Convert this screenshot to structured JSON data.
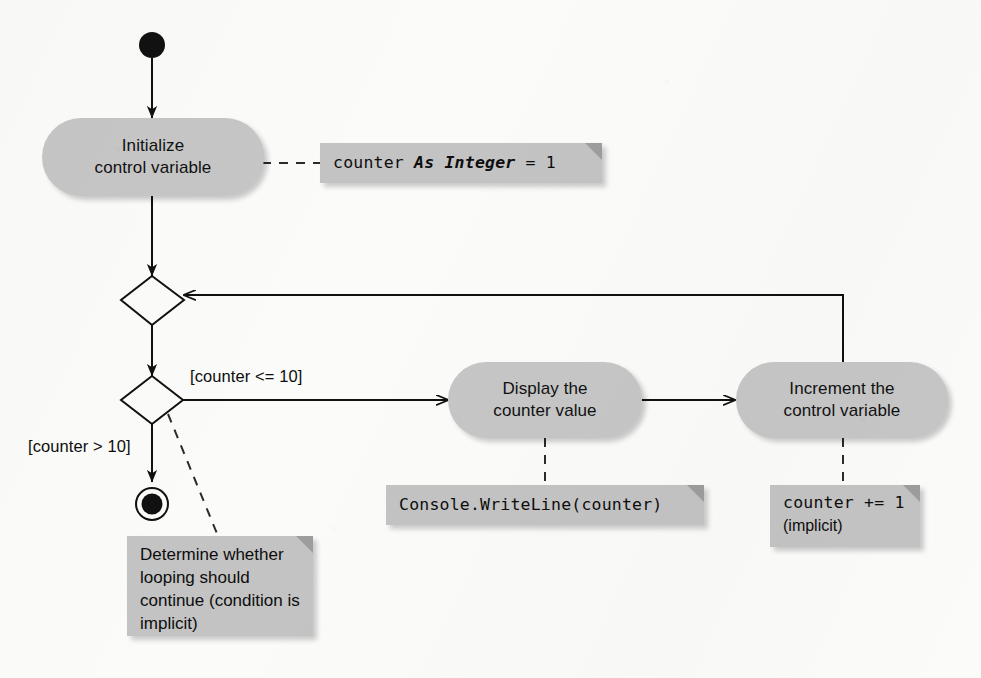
{
  "diagram": {
    "type": "uml-activity-diagram",
    "background_color": "#fbfbfa",
    "node_fill_color": "#c6c6c6",
    "note_fill_color": "#c3c3c3",
    "line_color": "#111111"
  },
  "nodes": {
    "initial": {
      "name": "initial-state",
      "kind": "initial-node"
    },
    "initialize": {
      "kind": "action",
      "line1": "Initialize",
      "line2": "control variable"
    },
    "merge": {
      "kind": "merge-node"
    },
    "decision": {
      "kind": "decision-node"
    },
    "display": {
      "kind": "action",
      "line1": "Display the",
      "line2": "counter value"
    },
    "increment": {
      "kind": "action",
      "line1": "Increment the",
      "line2": "control variable"
    },
    "final": {
      "kind": "final-node"
    }
  },
  "guards": {
    "loop_continue": "[counter <= 10]",
    "loop_exit": "[counter > 10]"
  },
  "notes": {
    "declaration": {
      "code_prefix": "counter ",
      "code_keyword": "As Integer",
      "code_suffix": " = 1"
    },
    "decision_explanation": {
      "line1": "Determine whether",
      "line2": "looping should",
      "line3": "continue (condition",
      "line4": "is implicit)"
    },
    "display_code": {
      "code": "Console.WriteLine(counter)"
    },
    "increment_code": {
      "code": "counter += 1",
      "comment": "(implicit)"
    }
  }
}
